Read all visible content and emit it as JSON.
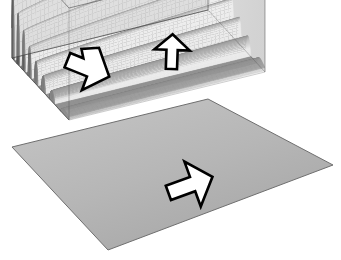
{
  "figure": {
    "background_color": "#ffffff",
    "render_style": "grayscale-shaded-surface"
  },
  "colors": {
    "background": "#ffffff",
    "base_plane": "#b4b4b4",
    "base_plane_edge": "#6f6f6f",
    "box_wire": "#4a4a4a",
    "box_face_tint": "#bcbcbc",
    "surface_light": "#ffffff",
    "surface_mid": "#a8a8a8",
    "surface_dark": "#3a3a3a",
    "annotation_stroke": "#000000",
    "annotation_fill": "#ffffff"
  },
  "bounding_box": {
    "label": "wireframe-bounding-box",
    "corners": {
      "top_back": [
        208,
        10
      ],
      "left_back": [
        12,
        58
      ],
      "right_back": [
        265,
        72
      ],
      "front_mid": [
        70,
        121
      ],
      "left_bottom": [
        12,
        147
      ],
      "front_bottom": [
        70,
        210
      ],
      "right_bottom": [
        265,
        161
      ]
    }
  },
  "base_plane": {
    "label": "ground-plane",
    "corners": {
      "left": [
        12,
        147
      ],
      "back": [
        208,
        99
      ],
      "right": [
        333,
        165
      ],
      "front": [
        108,
        250
      ]
    }
  },
  "surface": {
    "label": "wave-surface",
    "description": "Decaying oscillatory ridges running along the depth axis; amplitude is largest at the left/centre and decays toward the right edge.",
    "ridge_count": 22,
    "amplitude_profile": "exponentially decaying toward right",
    "frequency_profile": "high frequency at left edge, lower toward right",
    "shading": "diffuse light from upper-left"
  },
  "annotations": {
    "arrows": [
      {
        "name": "arrow-left-downright",
        "direction": "right-down",
        "angle_deg": 22,
        "position": [
          88,
          68
        ],
        "length": 44,
        "notched": true
      },
      {
        "name": "arrow-top-up",
        "direction": "up",
        "angle_deg": -88,
        "position": [
          172,
          52
        ],
        "length": 34,
        "notched": false
      },
      {
        "name": "arrow-bottom-upright",
        "direction": "right-up",
        "angle_deg": -20,
        "position": [
          190,
          185
        ],
        "length": 46,
        "notched": false
      }
    ]
  }
}
